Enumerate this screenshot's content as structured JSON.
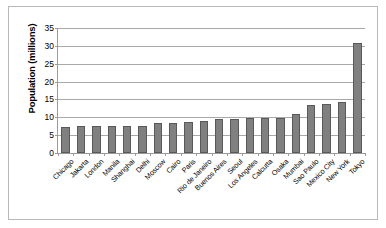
{
  "chart_data": {
    "type": "bar",
    "title": "",
    "xlabel": "",
    "ylabel": "Population (millions)",
    "ylim": [
      0,
      35
    ],
    "ytick_step": 5,
    "yticks": [
      0,
      5,
      10,
      15,
      20,
      25,
      30,
      35
    ],
    "grid": true,
    "legend": "none",
    "bar_color": "#808080",
    "bar_edge_color": "#595959",
    "categories": [
      "Chicago",
      "Jakarta",
      "London",
      "Manila",
      "Shanghai",
      "Delhi",
      "Moscow",
      "Cairo",
      "Paris",
      "Rio de Janeiro",
      "Buenos Aires",
      "Seoul",
      "Los Angeles",
      "Calcutta",
      "Osaka",
      "Mumbai",
      "Sao Paulo",
      "Mexico City",
      "New York",
      "Tokyo"
    ],
    "values": [
      7.2,
      7.5,
      7.5,
      7.6,
      7.7,
      7.7,
      8.4,
      8.5,
      8.7,
      8.9,
      9.6,
      9.6,
      9.7,
      9.8,
      9.8,
      10.8,
      13.4,
      13.6,
      14.3,
      30.8
    ]
  }
}
